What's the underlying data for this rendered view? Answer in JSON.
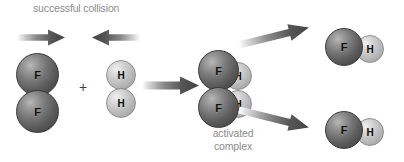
{
  "diagram": {
    "title": "successful collision",
    "complex_label": "activated complex",
    "plus": "+",
    "background_color": "#ffffff",
    "label_color": "#8c8c8c",
    "fluorine_color": "#5d5d5d",
    "hydrogen_color": "#c8c8c8",
    "arrow_color": "#4a4a4a"
  },
  "reactants": {
    "fluorine_molecule": {
      "formula": "F2",
      "atoms": [
        {
          "symbol": "F"
        },
        {
          "symbol": "F"
        }
      ]
    },
    "hydrogen_molecule": {
      "formula": "H2",
      "atoms": [
        {
          "symbol": "H"
        },
        {
          "symbol": "H"
        }
      ]
    }
  },
  "activated_complex": {
    "atoms": [
      {
        "symbol": "F"
      },
      {
        "symbol": "F"
      },
      {
        "symbol": "H"
      },
      {
        "symbol": "H"
      }
    ]
  },
  "products": [
    {
      "formula": "HF",
      "atoms": [
        {
          "symbol": "F"
        },
        {
          "symbol": "H"
        }
      ]
    },
    {
      "formula": "HF",
      "atoms": [
        {
          "symbol": "F"
        },
        {
          "symbol": "H"
        }
      ]
    }
  ],
  "arrows": {
    "collision_left": "arrow-right-icon",
    "collision_right": "arrow-left-icon",
    "reaction_main": "arrow-right-icon",
    "product_upper": "arrow-up-right-icon",
    "product_lower": "arrow-down-right-icon"
  }
}
